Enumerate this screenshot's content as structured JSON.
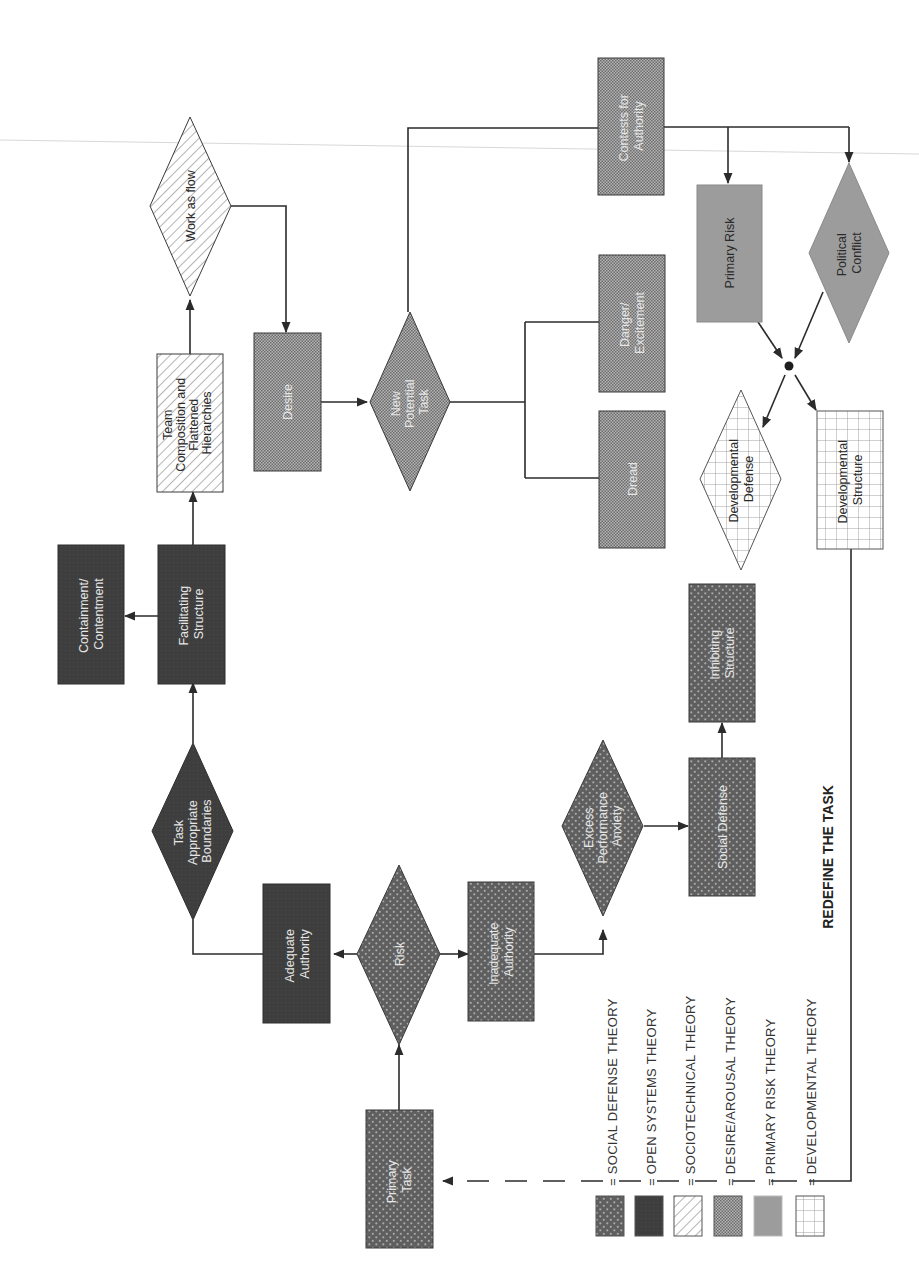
{
  "diagram": {
    "orientation": "rotated-90-ccw",
    "nodes": {
      "primary_task": {
        "label_1": "Primary",
        "label_2": "Task",
        "theory": "social_defense",
        "shape": "rect"
      },
      "risk": {
        "label_1": "Risk",
        "theory": "social_defense",
        "shape": "diamond"
      },
      "adequate_authority": {
        "label_1": "Adequate",
        "label_2": "Authority",
        "theory": "open_systems",
        "shape": "rect"
      },
      "inadequate_authority": {
        "label_1": "Inadequate",
        "label_2": "Authority",
        "theory": "social_defense",
        "shape": "rect"
      },
      "task_boundaries": {
        "label_1": "Task",
        "label_2": "Appropriate",
        "label_3": "Boundaries",
        "theory": "open_systems",
        "shape": "diamond"
      },
      "facilitating_structure": {
        "label_1": "Facilitating",
        "label_2": "Structure",
        "theory": "open_systems",
        "shape": "rect"
      },
      "containment": {
        "label_1": "Containment/",
        "label_2": "Contentment",
        "theory": "open_systems",
        "shape": "rect"
      },
      "team_composition": {
        "label_1": "Team",
        "label_2": "Composition and",
        "label_3": "Flattened",
        "label_4": "Hierarchies",
        "theory": "sociotechnical",
        "shape": "rect"
      },
      "work_as_flow": {
        "label_1": "Work as flow",
        "theory": "sociotechnical",
        "shape": "diamond"
      },
      "desire": {
        "label_1": "Desire",
        "theory": "desire_arousal",
        "shape": "rect"
      },
      "new_potential_task": {
        "label_1": "New",
        "label_2": "Potential",
        "label_3": "Task",
        "theory": "desire_arousal",
        "shape": "diamond"
      },
      "dread": {
        "label_1": "Dread",
        "theory": "desire_arousal",
        "shape": "rect"
      },
      "danger_excitement": {
        "label_1": "Danger/",
        "label_2": "Excitement",
        "theory": "desire_arousal",
        "shape": "rect"
      },
      "contests_for_authority": {
        "label_1": "Contests for",
        "label_2": "Authority",
        "theory": "desire_arousal",
        "shape": "rect"
      },
      "primary_risk": {
        "label_1": "Primary Risk",
        "theory": "primary_risk",
        "shape": "rect"
      },
      "political_conflict": {
        "label_1": "Political",
        "label_2": "Conflict",
        "theory": "primary_risk",
        "shape": "diamond"
      },
      "developmental_defense": {
        "label_1": "Developmental",
        "label_2": "Defense",
        "theory": "developmental",
        "shape": "diamond"
      },
      "developmental_structure": {
        "label_1": "Developmental",
        "label_2": "Structure",
        "theory": "developmental",
        "shape": "rect"
      },
      "excess_anxiety": {
        "label_1": "Excess",
        "label_2": "Performance",
        "label_3": "Anxiety",
        "theory": "social_defense",
        "shape": "diamond"
      },
      "social_defense": {
        "label_1": "Social Defense",
        "theory": "social_defense",
        "shape": "rect"
      },
      "inhibiting_structure": {
        "label_1": "Inhibiting",
        "label_2": "Structure",
        "theory": "social_defense",
        "shape": "rect"
      }
    },
    "edges": [
      {
        "from": "primary_task",
        "to": "risk"
      },
      {
        "from": "risk",
        "to": "adequate_authority"
      },
      {
        "from": "risk",
        "to": "inadequate_authority"
      },
      {
        "from": "adequate_authority",
        "to": "task_boundaries"
      },
      {
        "from": "task_boundaries",
        "to": "facilitating_structure"
      },
      {
        "from": "facilitating_structure",
        "to": "containment"
      },
      {
        "from": "facilitating_structure",
        "to": "team_composition"
      },
      {
        "from": "team_composition",
        "to": "work_as_flow"
      },
      {
        "from": "work_as_flow",
        "to": "desire"
      },
      {
        "from": "desire",
        "to": "new_potential_task"
      },
      {
        "from": "new_potential_task",
        "to": "dread"
      },
      {
        "from": "new_potential_task",
        "to": "danger_excitement"
      },
      {
        "from": "new_potential_task",
        "to": "contests_for_authority"
      },
      {
        "from": "contests_for_authority",
        "to": "primary_risk"
      },
      {
        "from": "contests_for_authority",
        "to": "political_conflict"
      },
      {
        "from": "primary_risk",
        "to": "junction"
      },
      {
        "from": "political_conflict",
        "to": "junction"
      },
      {
        "from": "junction",
        "to": "developmental_defense"
      },
      {
        "from": "junction",
        "to": "developmental_structure"
      },
      {
        "from": "inadequate_authority",
        "to": "excess_anxiety"
      },
      {
        "from": "excess_anxiety",
        "to": "social_defense"
      },
      {
        "from": "social_defense",
        "to": "inhibiting_structure"
      },
      {
        "from": "developmental_structure",
        "to": "primary_task",
        "label": "REDEFINE THE TASK"
      }
    ],
    "feedback_label": "REDEFINE THE TASK"
  },
  "legend": {
    "items": [
      {
        "key": "social_defense",
        "text": "= SOCIAL DEFENSE THEORY",
        "color": "#6e6e6e"
      },
      {
        "key": "open_systems",
        "text": "= OPEN SYSTEMS THEORY",
        "color": "#3f3f3f"
      },
      {
        "key": "sociotechnical",
        "text": "= SOCIOTECHNICAL THEORY",
        "color": "#ffffff"
      },
      {
        "key": "desire_arousal",
        "text": "= DESIRE/AROUSAL THEORY",
        "color": "#9a9a9a"
      },
      {
        "key": "primary_risk",
        "text": "= PRIMARY RISK THEORY",
        "color": "#9d9d9d"
      },
      {
        "key": "developmental",
        "text": "= DEVELOPMENTAL THEORY",
        "color": "#ffffff"
      }
    ]
  },
  "colors": {
    "line": "#2b2b2b",
    "open_systems_fill": "#3f3f3f",
    "social_defense_fill": "#6a6a6a",
    "desire_fill": "#9a9a9a",
    "primary_risk_fill": "#9d9d9d",
    "background": "#ffffff"
  }
}
